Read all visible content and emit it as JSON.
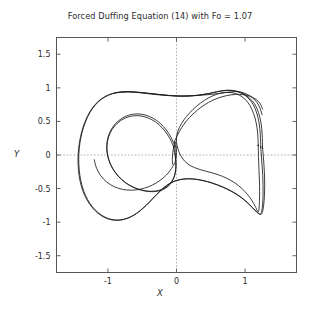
{
  "chart_data": {
    "type": "line",
    "title": "Forced Duffing Equation (14) with Fo = 1.07",
    "xlabel": "X",
    "ylabel": "Y",
    "xlim": [
      -1.75,
      1.75
    ],
    "ylim": [
      -1.75,
      1.75
    ],
    "xticks": [
      -1,
      0,
      1
    ],
    "xtick_labels": [
      "-1",
      "0",
      "1"
    ],
    "yticks": [
      1.5,
      1,
      0.5,
      0,
      -0.5,
      -1,
      -1.5
    ],
    "ytick_labels": [
      "1.5",
      "1",
      "0.5",
      "0",
      "-0.5",
      "-1",
      "-1.5"
    ],
    "grid": "dashed-zero-lines-only",
    "legend": "none",
    "line_color": "#1a1a1a",
    "series": [
      {
        "name": "phase-trajectory-outer-1",
        "points": [
          [
            1.255,
            0.1
          ],
          [
            1.25,
            0.3
          ],
          [
            1.232,
            0.48
          ],
          [
            1.196,
            0.63
          ],
          [
            1.14,
            0.76
          ],
          [
            1.062,
            0.85
          ],
          [
            0.968,
            0.92
          ],
          [
            0.862,
            0.955
          ],
          [
            0.742,
            0.965
          ],
          [
            0.612,
            0.948
          ],
          [
            0.478,
            0.918
          ],
          [
            0.34,
            0.895
          ],
          [
            0.196,
            0.88
          ],
          [
            0.045,
            0.878
          ],
          [
            -0.11,
            0.888
          ],
          [
            -0.262,
            0.903
          ],
          [
            -0.41,
            0.92
          ],
          [
            -0.552,
            0.935
          ],
          [
            -0.686,
            0.944
          ],
          [
            -0.812,
            0.94
          ],
          [
            -0.93,
            0.918
          ],
          [
            -1.04,
            0.872
          ],
          [
            -1.14,
            0.8
          ],
          [
            -1.228,
            0.7
          ],
          [
            -1.3,
            0.575
          ],
          [
            -1.358,
            0.43
          ],
          [
            -1.4,
            0.272
          ],
          [
            -1.426,
            0.108
          ],
          [
            -1.436,
            -0.058
          ],
          [
            -1.43,
            -0.222
          ],
          [
            -1.408,
            -0.38
          ],
          [
            -1.368,
            -0.528
          ],
          [
            -1.31,
            -0.66
          ],
          [
            -1.238,
            -0.772
          ],
          [
            -1.152,
            -0.862
          ],
          [
            -1.055,
            -0.928
          ],
          [
            -0.95,
            -0.965
          ],
          [
            -0.84,
            -0.972
          ],
          [
            -0.73,
            -0.948
          ],
          [
            -0.626,
            -0.898
          ],
          [
            -0.53,
            -0.83
          ],
          [
            -0.444,
            -0.752
          ],
          [
            -0.366,
            -0.67
          ],
          [
            -0.292,
            -0.59
          ],
          [
            -0.218,
            -0.516
          ],
          [
            -0.14,
            -0.452
          ],
          [
            -0.052,
            -0.4
          ],
          [
            0.048,
            -0.368
          ],
          [
            0.165,
            -0.355
          ],
          [
            0.3,
            -0.365
          ],
          [
            0.448,
            -0.398
          ],
          [
            0.598,
            -0.448
          ],
          [
            0.74,
            -0.51
          ],
          [
            0.868,
            -0.582
          ],
          [
            0.978,
            -0.662
          ],
          [
            1.068,
            -0.745
          ],
          [
            1.14,
            -0.82
          ],
          [
            1.194,
            -0.872
          ],
          [
            1.232,
            -0.885
          ],
          [
            1.256,
            -0.84
          ],
          [
            1.272,
            -0.74
          ],
          [
            1.282,
            -0.608
          ],
          [
            1.286,
            -0.462
          ],
          [
            1.284,
            -0.312
          ],
          [
            1.276,
            -0.162
          ],
          [
            1.266,
            -0.018
          ],
          [
            1.255,
            0.1
          ]
        ]
      },
      {
        "name": "phase-trajectory-outer-2",
        "points": [
          [
            1.228,
            0.12
          ],
          [
            1.222,
            0.31
          ],
          [
            1.204,
            0.48
          ],
          [
            1.17,
            0.625
          ],
          [
            1.118,
            0.752
          ],
          [
            1.046,
            0.848
          ],
          [
            0.956,
            0.916
          ],
          [
            0.852,
            0.952
          ],
          [
            0.734,
            0.962
          ],
          [
            0.606,
            0.944
          ],
          [
            0.472,
            0.914
          ],
          [
            0.334,
            0.892
          ],
          [
            0.19,
            0.878
          ],
          [
            0.04,
            0.876
          ],
          [
            -0.116,
            0.886
          ],
          [
            -0.268,
            0.902
          ],
          [
            -0.416,
            0.918
          ],
          [
            -0.556,
            0.932
          ],
          [
            -0.69,
            0.94
          ],
          [
            -0.816,
            0.935
          ],
          [
            -0.934,
            0.912
          ],
          [
            -1.044,
            0.864
          ],
          [
            -1.142,
            0.79
          ],
          [
            -1.228,
            0.688
          ],
          [
            -1.298,
            0.562
          ],
          [
            -1.354,
            0.418
          ],
          [
            -1.394,
            0.262
          ],
          [
            -1.418,
            0.098
          ],
          [
            -1.426,
            -0.068
          ],
          [
            -1.418,
            -0.23
          ],
          [
            -1.394,
            -0.388
          ],
          [
            -1.354,
            -0.534
          ],
          [
            -1.296,
            -0.664
          ],
          [
            -1.224,
            -0.774
          ],
          [
            -1.138,
            -0.862
          ],
          [
            -1.042,
            -0.926
          ],
          [
            -0.938,
            -0.962
          ],
          [
            -0.83,
            -0.968
          ],
          [
            -0.722,
            -0.944
          ],
          [
            -0.62,
            -0.894
          ],
          [
            -0.526,
            -0.826
          ],
          [
            -0.44,
            -0.748
          ],
          [
            -0.362,
            -0.666
          ],
          [
            -0.288,
            -0.588
          ],
          [
            -0.214,
            -0.514
          ],
          [
            -0.136,
            -0.45
          ],
          [
            -0.048,
            -0.398
          ],
          [
            0.052,
            -0.366
          ],
          [
            0.17,
            -0.353
          ],
          [
            0.306,
            -0.364
          ],
          [
            0.454,
            -0.396
          ],
          [
            0.604,
            -0.446
          ],
          [
            0.744,
            -0.508
          ],
          [
            0.872,
            -0.58
          ],
          [
            0.982,
            -0.66
          ],
          [
            1.07,
            -0.742
          ],
          [
            1.14,
            -0.816
          ],
          [
            1.192,
            -0.866
          ],
          [
            1.226,
            -0.876
          ],
          [
            1.244,
            -0.828
          ],
          [
            1.256,
            -0.73
          ],
          [
            1.262,
            -0.6
          ],
          [
            1.262,
            -0.456
          ],
          [
            1.258,
            -0.308
          ],
          [
            1.248,
            -0.158
          ],
          [
            1.238,
            -0.014
          ],
          [
            1.228,
            0.12
          ]
        ]
      },
      {
        "name": "phase-trajectory-right-lobe-inner",
        "points": [
          [
            1.192,
            0.14
          ],
          [
            1.184,
            0.32
          ],
          [
            1.162,
            0.48
          ],
          [
            1.124,
            0.618
          ],
          [
            1.07,
            0.738
          ],
          [
            0.998,
            0.832
          ],
          [
            0.91,
            0.896
          ],
          [
            0.808,
            0.928
          ],
          [
            0.696,
            0.93
          ],
          [
            0.58,
            0.902
          ],
          [
            0.462,
            0.848
          ],
          [
            0.348,
            0.772
          ],
          [
            0.242,
            0.68
          ],
          [
            0.148,
            0.576
          ],
          [
            0.072,
            0.468
          ],
          [
            0.022,
            0.36
          ],
          [
            0.0,
            0.252
          ],
          [
            0.006,
            0.15
          ],
          [
            0.032,
            0.056
          ],
          [
            0.072,
            -0.026
          ],
          [
            0.122,
            -0.094
          ],
          [
            0.186,
            -0.148
          ],
          [
            0.268,
            -0.19
          ],
          [
            0.368,
            -0.224
          ],
          [
            0.484,
            -0.256
          ],
          [
            0.608,
            -0.294
          ],
          [
            0.732,
            -0.346
          ],
          [
            0.848,
            -0.414
          ],
          [
            0.95,
            -0.496
          ],
          [
            1.034,
            -0.586
          ],
          [
            1.1,
            -0.678
          ],
          [
            1.148,
            -0.764
          ],
          [
            1.178,
            -0.83
          ],
          [
            1.194,
            -0.846
          ],
          [
            1.204,
            -0.79
          ],
          [
            1.21,
            -0.678
          ],
          [
            1.212,
            -0.544
          ],
          [
            1.21,
            -0.398
          ],
          [
            1.204,
            -0.25
          ],
          [
            1.198,
            -0.102
          ],
          [
            1.192,
            0.14
          ]
        ]
      },
      {
        "name": "phase-trajectory-left-lobe-inner-1",
        "points": [
          [
            -0.022,
            0.132
          ],
          [
            -0.076,
            0.256
          ],
          [
            -0.148,
            0.372
          ],
          [
            -0.238,
            0.472
          ],
          [
            -0.342,
            0.548
          ],
          [
            -0.456,
            0.596
          ],
          [
            -0.576,
            0.612
          ],
          [
            -0.694,
            0.594
          ],
          [
            -0.802,
            0.542
          ],
          [
            -0.894,
            0.462
          ],
          [
            -0.962,
            0.36
          ],
          [
            -1.004,
            0.244
          ],
          [
            -1.018,
            0.12
          ],
          [
            -1.006,
            -0.004
          ],
          [
            -0.97,
            -0.122
          ],
          [
            -0.914,
            -0.23
          ],
          [
            -0.842,
            -0.324
          ],
          [
            -0.758,
            -0.402
          ],
          [
            -0.664,
            -0.462
          ],
          [
            -0.564,
            -0.506
          ],
          [
            -0.462,
            -0.532
          ],
          [
            -0.36,
            -0.54
          ],
          [
            -0.262,
            -0.528
          ],
          [
            -0.176,
            -0.494
          ],
          [
            -0.104,
            -0.438
          ],
          [
            -0.052,
            -0.362
          ],
          [
            -0.02,
            -0.27
          ],
          [
            -0.008,
            -0.168
          ],
          [
            -0.01,
            -0.062
          ],
          [
            -0.018,
            0.04
          ],
          [
            -0.022,
            0.132
          ]
        ]
      },
      {
        "name": "phase-trajectory-left-lobe-inner-2",
        "points": [
          [
            -0.04,
            0.118
          ],
          [
            -0.094,
            0.24
          ],
          [
            -0.166,
            0.354
          ],
          [
            -0.256,
            0.452
          ],
          [
            -0.36,
            0.526
          ],
          [
            -0.474,
            0.572
          ],
          [
            -0.592,
            0.586
          ],
          [
            -0.708,
            0.566
          ],
          [
            -0.814,
            0.512
          ],
          [
            -0.902,
            0.432
          ],
          [
            -0.966,
            0.33
          ],
          [
            -1.004,
            0.214
          ],
          [
            -1.014,
            0.092
          ],
          [
            -0.998,
            -0.03
          ],
          [
            -0.958,
            -0.146
          ],
          [
            -0.898,
            -0.25
          ],
          [
            -0.822,
            -0.342
          ],
          [
            -0.736,
            -0.418
          ],
          [
            -0.64,
            -0.476
          ],
          [
            -0.54,
            -0.516
          ],
          [
            -0.438,
            -0.54
          ],
          [
            -0.338,
            -0.546
          ],
          [
            -0.244,
            -0.532
          ],
          [
            -0.162,
            -0.496
          ],
          [
            -0.094,
            -0.438
          ],
          [
            -0.046,
            -0.36
          ],
          [
            -0.018,
            -0.268
          ],
          [
            -0.008,
            -0.166
          ],
          [
            -0.014,
            -0.06
          ],
          [
            -0.028,
            0.036
          ],
          [
            -0.04,
            0.118
          ]
        ]
      },
      {
        "name": "phase-trajectory-crossing-knot",
        "points": [
          [
            -0.024,
            0.196
          ],
          [
            -0.01,
            0.15
          ],
          [
            -0.002,
            0.094
          ],
          [
            0.0,
            0.034
          ],
          [
            -0.004,
            -0.026
          ],
          [
            -0.014,
            -0.082
          ],
          [
            -0.028,
            -0.128
          ],
          [
            -0.042,
            -0.154
          ],
          [
            -0.054,
            -0.14
          ],
          [
            -0.06,
            -0.094
          ],
          [
            -0.06,
            -0.032
          ],
          [
            -0.054,
            0.032
          ],
          [
            -0.044,
            0.096
          ],
          [
            -0.034,
            0.152
          ],
          [
            -0.024,
            0.196
          ]
        ]
      },
      {
        "name": "phase-trajectory-transfer-upper",
        "points": [
          [
            -0.03,
            0.2
          ],
          [
            0.016,
            0.3
          ],
          [
            0.074,
            0.406
          ],
          [
            0.148,
            0.51
          ],
          [
            0.24,
            0.61
          ],
          [
            0.346,
            0.702
          ],
          [
            0.466,
            0.782
          ],
          [
            0.596,
            0.844
          ],
          [
            0.73,
            0.884
          ],
          [
            0.86,
            0.902
          ],
          [
            0.978,
            0.898
          ],
          [
            1.08,
            0.872
          ],
          [
            1.162,
            0.826
          ],
          [
            1.222,
            0.762
          ],
          [
            1.256,
            0.684
          ]
        ]
      },
      {
        "name": "phase-trajectory-transfer-lower",
        "points": [
          [
            -0.048,
            -0.16
          ],
          [
            -0.11,
            -0.254
          ],
          [
            -0.192,
            -0.34
          ],
          [
            -0.292,
            -0.414
          ],
          [
            -0.406,
            -0.472
          ],
          [
            -0.53,
            -0.51
          ],
          [
            -0.658,
            -0.524
          ],
          [
            -0.786,
            -0.512
          ],
          [
            -0.908,
            -0.472
          ],
          [
            -1.016,
            -0.404
          ],
          [
            -1.104,
            -0.31
          ],
          [
            -1.166,
            -0.196
          ],
          [
            -1.2,
            -0.07
          ]
        ]
      },
      {
        "name": "phase-trajectory-diagonal-sweep",
        "points": [
          [
            -0.9,
            0.926
          ],
          [
            -0.7,
            0.94
          ],
          [
            -0.5,
            0.924
          ],
          [
            -0.3,
            0.9
          ],
          [
            -0.1,
            0.884
          ],
          [
            0.1,
            0.88
          ],
          [
            0.3,
            0.886
          ],
          [
            0.5,
            0.902
          ],
          [
            0.7,
            0.928
          ],
          [
            0.88,
            0.944
          ],
          [
            1.02,
            0.908
          ],
          [
            1.128,
            0.836
          ],
          [
            1.204,
            0.73
          ],
          [
            1.248,
            0.6
          ]
        ]
      }
    ]
  }
}
